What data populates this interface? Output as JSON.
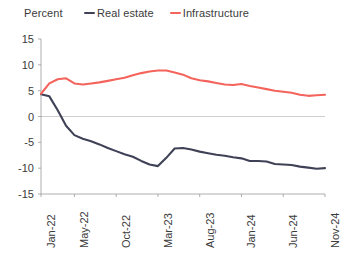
{
  "chart_data": {
    "type": "line",
    "title": "",
    "ylabel": "Percent",
    "xlabel": "",
    "ylim": [
      -15,
      15
    ],
    "y_ticks": [
      15,
      10,
      5,
      0,
      -5,
      -10,
      -15
    ],
    "x_tick_labels": [
      "Jan-22",
      "May-22",
      "Oct-22",
      "Mar-23",
      "Aug-23",
      "Jan-24",
      "Jun-24",
      "Nov-24"
    ],
    "x_tick_indices": [
      0,
      4,
      9,
      14,
      19,
      24,
      29,
      34
    ],
    "x": [
      "Jan-22",
      "Feb-22",
      "Mar-22",
      "Apr-22",
      "May-22",
      "Jun-22",
      "Jul-22",
      "Aug-22",
      "Sep-22",
      "Oct-22",
      "Nov-22",
      "Dec-22",
      "Jan-23",
      "Feb-23",
      "Mar-23",
      "Apr-23",
      "May-23",
      "Jun-23",
      "Jul-23",
      "Aug-23",
      "Sep-23",
      "Oct-23",
      "Nov-23",
      "Dec-23",
      "Jan-24",
      "Feb-24",
      "Mar-24",
      "Apr-24",
      "May-24",
      "Jun-24",
      "Jul-24",
      "Aug-24",
      "Sep-24",
      "Oct-24",
      "Nov-24"
    ],
    "grid": false,
    "legend_position": "top",
    "series": [
      {
        "name": "Real estate",
        "color": "#3f4256",
        "values": [
          4.3,
          3.9,
          1.2,
          -1.8,
          -3.6,
          -4.3,
          -4.8,
          -5.4,
          -6.1,
          -6.7,
          -7.3,
          -7.8,
          -8.6,
          -9.3,
          -9.6,
          -8.0,
          -6.2,
          -6.1,
          -6.4,
          -6.8,
          -7.1,
          -7.4,
          -7.6,
          -7.9,
          -8.1,
          -8.6,
          -8.6,
          -8.7,
          -9.2,
          -9.3,
          -9.4,
          -9.7,
          -9.9,
          -10.1,
          -10.0
        ]
      },
      {
        "name": "Infrastructure",
        "color": "#f4635c",
        "values": [
          4.4,
          6.4,
          7.2,
          7.4,
          6.4,
          6.2,
          6.4,
          6.6,
          6.9,
          7.2,
          7.5,
          8.0,
          8.4,
          8.7,
          8.9,
          8.9,
          8.5,
          8.1,
          7.4,
          7.0,
          6.8,
          6.5,
          6.2,
          6.1,
          6.3,
          5.9,
          5.6,
          5.3,
          5.0,
          4.8,
          4.6,
          4.2,
          4.0,
          4.1,
          4.2
        ]
      }
    ]
  },
  "legend": {
    "items": [
      {
        "label": "Real estate",
        "color": "#3f4256",
        "icon": "line-swatch-icon"
      },
      {
        "label": "Infrastructure",
        "color": "#f4635c",
        "icon": "line-swatch-icon"
      }
    ]
  },
  "axis": {
    "unit_title": "Percent"
  }
}
